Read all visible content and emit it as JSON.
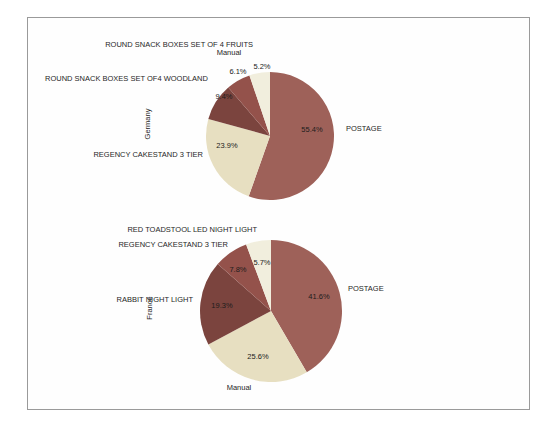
{
  "figure": {
    "background_color": "#fefefe",
    "frame_border_color": "#9a9a9a"
  },
  "chart_data": [
    {
      "type": "pie",
      "title": "",
      "ylabel": "Germany",
      "direction": "clockwise",
      "start_angle": "12-o-clock",
      "slices": [
        {
          "label": "POSTAGE",
          "value_pct": 55.4,
          "pct_label": "55.4%",
          "color": "#9e6159"
        },
        {
          "label": "REGENCY CAKESTAND 3 TIER",
          "value_pct": 23.9,
          "pct_label": "23.9%",
          "color": "#e7dfc1"
        },
        {
          "label": "ROUND SNACK BOXES SET OF4 WOODLAND",
          "value_pct": 9.4,
          "pct_label": "9.4%",
          "color": "#7b443e"
        },
        {
          "label": "ROUND SNACK BOXES SET OF 4 FRUITS",
          "value_pct": 6.1,
          "pct_label": "6.1%",
          "color": "#94524b"
        },
        {
          "label": "Manual",
          "value_pct": 5.2,
          "pct_label": "5.2%",
          "color": "#f1eedd"
        }
      ]
    },
    {
      "type": "pie",
      "title": "",
      "ylabel": "France",
      "direction": "clockwise",
      "start_angle": "12-o-clock",
      "slices": [
        {
          "label": "POSTAGE",
          "value_pct": 41.6,
          "pct_label": "41.6%",
          "color": "#9e6159"
        },
        {
          "label": "Manual",
          "value_pct": 25.6,
          "pct_label": "25.6%",
          "color": "#e7dfc1"
        },
        {
          "label": "RABBIT NIGHT LIGHT",
          "value_pct": 19.3,
          "pct_label": "19.3%",
          "color": "#7b443e"
        },
        {
          "label": "REGENCY CAKESTAND 3 TIER",
          "value_pct": 7.8,
          "pct_label": "7.8%",
          "color": "#94524b"
        },
        {
          "label": "RED TOADSTOOL LED NIGHT LIGHT",
          "value_pct": 5.7,
          "pct_label": "5.7%",
          "color": "#f1eedd"
        }
      ]
    }
  ]
}
